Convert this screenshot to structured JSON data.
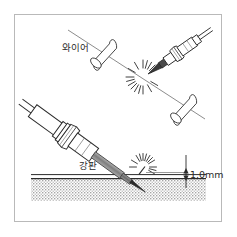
{
  "figure": {
    "background_color": "#ffffff",
    "border_color": "#b9b9b9",
    "ink_color": "#2b2b2b",
    "electrode_fill": "#8a8a8a",
    "plate_hatch_color": "#9a9a9a"
  },
  "labels": {
    "wire": "와이어",
    "steel_plate": "강판",
    "gap_dimension": "1.0mm"
  },
  "upper_scene": {
    "name": "wire-welding-scene",
    "torch_label": "welding-torch",
    "spark_label": "spark-burst",
    "wire_line_label": "wire-axis-line",
    "wire_segments": [
      {
        "name": "wire-segment-upper-left"
      },
      {
        "name": "wire-segment-lower-right"
      }
    ]
  },
  "lower_scene": {
    "name": "plate-welding-scene",
    "torch_label": "welding-torch-large",
    "spark_label": "spark-burst",
    "plate_label": "steel-plate",
    "dimension_label": "gap-dimension"
  }
}
